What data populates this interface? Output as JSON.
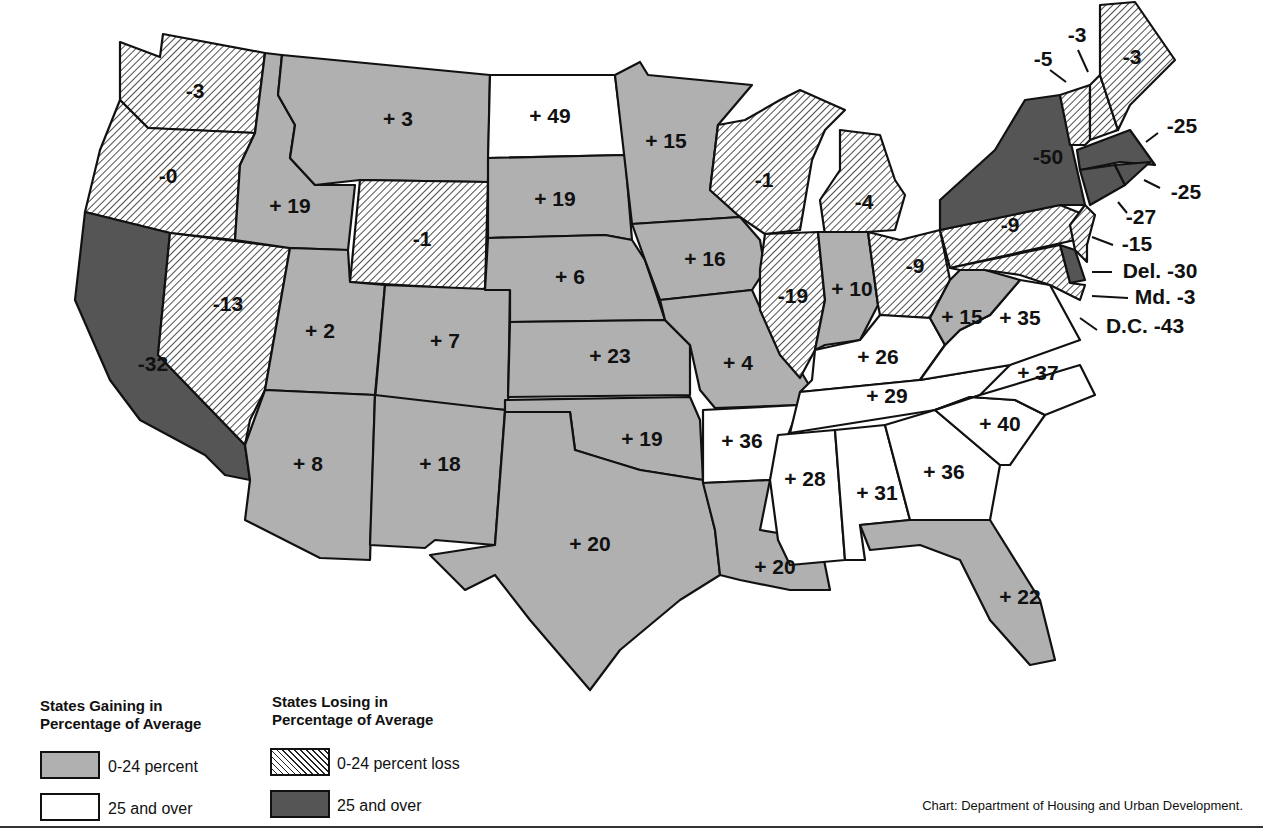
{
  "colors": {
    "gain_0_24": "#b0b0b0",
    "gain_25_over": "#ffffff",
    "loss_0_24": "hatched",
    "loss_25_over": "#555555",
    "outline": "#111111"
  },
  "legend": {
    "gain_title": "States Gaining in Percentage of Average",
    "gain_title_line1": "States Gaining in",
    "gain_title_line2": "Percentage of Average",
    "gain_items": [
      "0-24 percent",
      "25 and over"
    ],
    "loss_title_line1": "States Losing in",
    "loss_title_line2": "Percentage of Average",
    "loss_items": [
      "0-24 percent loss",
      "25 and over"
    ]
  },
  "source": "Chart: Department of Housing and Urban Development.",
  "states": {
    "WA": {
      "label": "-3",
      "cat": "loss"
    },
    "OR": {
      "label": "-0",
      "cat": "loss"
    },
    "CA": {
      "label": "-32",
      "cat": "loss25"
    },
    "NV": {
      "label": "-13",
      "cat": "loss"
    },
    "ID": {
      "label": "+ 19",
      "cat": "gain"
    },
    "MT": {
      "label": "+ 3",
      "cat": "gain"
    },
    "WY": {
      "label": "-1",
      "cat": "loss"
    },
    "UT": {
      "label": "+ 2",
      "cat": "gain"
    },
    "CO": {
      "label": "+ 7",
      "cat": "gain"
    },
    "AZ": {
      "label": "+ 8",
      "cat": "gain"
    },
    "NM": {
      "label": "+ 18",
      "cat": "gain"
    },
    "ND": {
      "label": "+ 49",
      "cat": "gain25"
    },
    "SD": {
      "label": "+ 19",
      "cat": "gain"
    },
    "NE": {
      "label": "+ 6",
      "cat": "gain"
    },
    "KS": {
      "label": "+ 23",
      "cat": "gain"
    },
    "OK": {
      "label": "+ 19",
      "cat": "gain"
    },
    "TX": {
      "label": "+ 20",
      "cat": "gain"
    },
    "MN": {
      "label": "+ 15",
      "cat": "gain"
    },
    "IA": {
      "label": "+ 16",
      "cat": "gain"
    },
    "MO": {
      "label": "+ 4",
      "cat": "gain"
    },
    "AR": {
      "label": "+ 36",
      "cat": "gain25"
    },
    "LA": {
      "label": "+ 20",
      "cat": "gain"
    },
    "WI": {
      "label": "-1",
      "cat": "loss"
    },
    "IL": {
      "label": "-19",
      "cat": "loss"
    },
    "MI": {
      "label": "-4",
      "cat": "loss"
    },
    "IN": {
      "label": "+ 10",
      "cat": "gain"
    },
    "OH": {
      "label": "-9",
      "cat": "loss"
    },
    "KY": {
      "label": "+ 26",
      "cat": "gain25"
    },
    "TN": {
      "label": "+ 29",
      "cat": "gain25"
    },
    "MS": {
      "label": "+ 28",
      "cat": "gain25"
    },
    "AL": {
      "label": "+ 31",
      "cat": "gain25"
    },
    "GA": {
      "label": "+ 36",
      "cat": "gain25"
    },
    "FL": {
      "label": "+ 22",
      "cat": "gain"
    },
    "SC": {
      "label": "+ 40",
      "cat": "gain25"
    },
    "NC": {
      "label": "+ 37",
      "cat": "gain25"
    },
    "VA": {
      "label": "+ 35",
      "cat": "gain25"
    },
    "WV": {
      "label": "+ 15",
      "cat": "gain"
    },
    "PA": {
      "label": "-9",
      "cat": "loss"
    },
    "NY": {
      "label": "-50",
      "cat": "loss25"
    },
    "VT": {
      "label": "-5",
      "cat": "loss"
    },
    "NH": {
      "label": "-3",
      "cat": "loss"
    },
    "ME": {
      "label": "-3",
      "cat": "loss"
    },
    "MA": {
      "label": "-25",
      "cat": "loss25"
    },
    "RI": {
      "label": "-25",
      "cat": "loss25"
    },
    "CT": {
      "label": "-27",
      "cat": "loss25"
    },
    "NJ": {
      "label": "-15",
      "cat": "loss"
    },
    "DE": {
      "label": "Del. -30",
      "cat": "loss25"
    },
    "MD": {
      "label": "Md. -3",
      "cat": "loss"
    },
    "DC": {
      "label": "D.C. -43",
      "cat": "loss25"
    }
  }
}
